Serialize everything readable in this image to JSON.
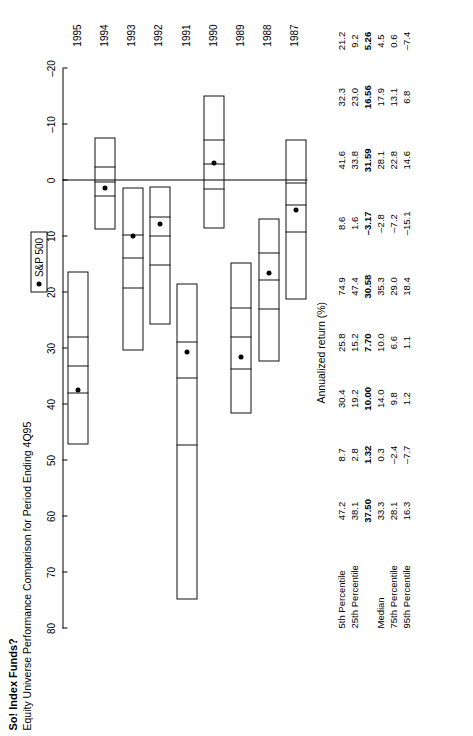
{
  "title": "So! Index Funds?",
  "subtitle": "Equity Universe Performance Comparison for Period Ending 4Q95",
  "legend": {
    "label": "S&P 500",
    "marker": "filled-circle"
  },
  "axis": {
    "title": "Annualized return (%)",
    "ticks": [
      "80",
      "70",
      "60",
      "50",
      "40",
      "30",
      "20",
      "10",
      "0",
      "–10",
      "–20"
    ],
    "min": -20,
    "max": 80
  },
  "table": {
    "row_labels": [
      "5th Percentile",
      "25th Percentile",
      "Median",
      "75th Percentile",
      "95th Percentile"
    ],
    "years": [
      "1995",
      "1994",
      "1993",
      "1992",
      "1991",
      "1990",
      "1989",
      "1988",
      "1987"
    ]
  },
  "chart_data": {
    "type": "box",
    "title": "So! Index Funds?",
    "subtitle": "Equity Universe Performance Comparison for Period Ending 4Q95",
    "ylabel": "Annualized return (%)",
    "xlabel": "",
    "ylim": [
      -20,
      80
    ],
    "grid": false,
    "legend_position": "top-right",
    "categories": [
      "1995",
      "1994",
      "1993",
      "1992",
      "1991",
      "1990",
      "1989",
      "1988",
      "1987"
    ],
    "series": [
      {
        "name": "5th Percentile",
        "values": [
          47.2,
          8.7,
          30.4,
          25.8,
          74.9,
          8.6,
          41.6,
          32.3,
          21.2
        ]
      },
      {
        "name": "25th Percentile",
        "values": [
          38.1,
          2.8,
          19.2,
          15.2,
          47.4,
          1.6,
          33.8,
          23.0,
          9.2
        ]
      },
      {
        "name": "Median",
        "values": [
          33.3,
          0.3,
          14.0,
          10.0,
          35.3,
          -2.8,
          28.1,
          17.9,
          4.5
        ]
      },
      {
        "name": "75th Percentile",
        "values": [
          28.1,
          -2.4,
          9.8,
          6.6,
          29.0,
          -7.2,
          22.8,
          13.1,
          0.6
        ]
      },
      {
        "name": "95th Percentile",
        "values": [
          16.3,
          -7.7,
          1.2,
          1.1,
          18.4,
          -15.1,
          14.6,
          6.8,
          -7.4
        ]
      },
      {
        "name": "S&P 500",
        "values": [
          37.5,
          1.32,
          10.0,
          7.7,
          30.58,
          -3.17,
          31.59,
          16.56,
          5.26
        ]
      }
    ],
    "cells": {
      "1995": {
        "p5": "47.2",
        "p25": "38.1",
        "median": "33.3",
        "p75": "28.1",
        "p95": "16.3",
        "sp500": "37.50"
      },
      "1994": {
        "p5": "8.7",
        "p25": "2.8",
        "median": "0.3",
        "p75": "–2.4",
        "p95": "–7.7",
        "sp500": "1.32"
      },
      "1993": {
        "p5": "30.4",
        "p25": "19.2",
        "median": "14.0",
        "p75": "9.8",
        "p95": "1.2",
        "sp500": "10.00"
      },
      "1992": {
        "p5": "25.8",
        "p25": "15.2",
        "median": "10.0",
        "p75": "6.6",
        "p95": "1.1",
        "sp500": "7.70"
      },
      "1991": {
        "p5": "74.9",
        "p25": "47.4",
        "median": "35.3",
        "p75": "29.0",
        "p95": "18.4",
        "sp500": "30.58"
      },
      "1990": {
        "p5": "8.6",
        "p25": "1.6",
        "median": "–2.8",
        "p75": "–7.2",
        "p95": "–15.1",
        "sp500": "–3.17"
      },
      "1989": {
        "p5": "41.6",
        "p25": "33.8",
        "median": "28.1",
        "p75": "22.8",
        "p95": "14.6",
        "sp500": "31.59"
      },
      "1988": {
        "p5": "32.3",
        "p25": "23.0",
        "median": "17.9",
        "p75": "13.1",
        "p95": "6.8",
        "sp500": "16.56"
      },
      "1987": {
        "p5": "21.2",
        "p25": "9.2",
        "median": "4.5",
        "p75": "0.6",
        "p95": "–7.4",
        "sp500": "5.26"
      }
    }
  }
}
